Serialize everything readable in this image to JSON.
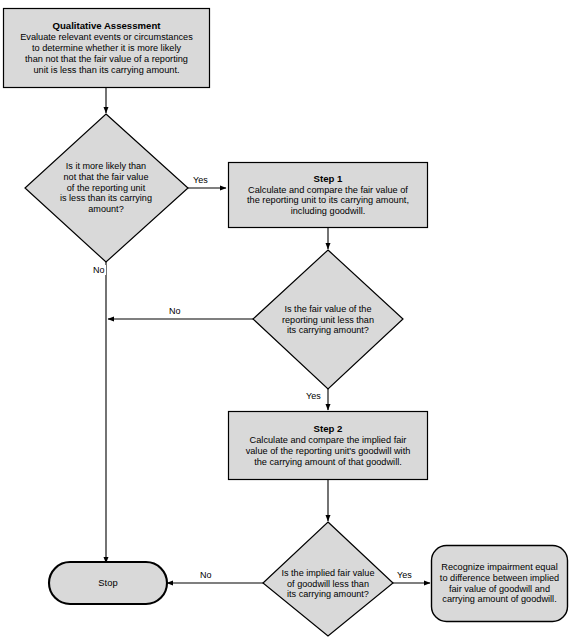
{
  "diagram": {
    "type": "flowchart",
    "top_caption": "",
    "colors": {
      "shape_fill": "#d9d9d9",
      "shape_stroke": "#000000",
      "connector": "#000000",
      "text": "#000000",
      "background": "#ffffff"
    },
    "nodes": {
      "qualitative_assessment": {
        "shape": "process",
        "title": "Qualitative Assessment",
        "lines": [
          "Evaluate relevant events or circumstances",
          "to determine whether it is more likely",
          "than not that the fair value of a reporting",
          "unit is less than its carrying amount."
        ]
      },
      "decision_1": {
        "shape": "decision",
        "lines": [
          "Is it more likely than",
          "not that the fair value",
          "of the reporting unit",
          "is less than its carrying",
          "amount?"
        ]
      },
      "step_1": {
        "shape": "process",
        "title": "Step 1",
        "lines": [
          "Calculate and compare the fair value of",
          "the reporting unit to its carrying amount,",
          "including goodwill."
        ]
      },
      "decision_2": {
        "shape": "decision",
        "lines": [
          "Is the fair value of the",
          "reporting unit less than",
          "its carrying amount?"
        ]
      },
      "step_2": {
        "shape": "process",
        "title": "Step 2",
        "lines": [
          "Calculate and compare the implied fair",
          "value of the reporting unit's goodwill with",
          "the carrying amount of that goodwill."
        ]
      },
      "decision_3": {
        "shape": "decision",
        "lines": [
          "Is the implied fair value",
          "of goodwill less than",
          "its carrying amount?"
        ]
      },
      "stop": {
        "shape": "terminator",
        "label": "Stop"
      },
      "recognize_impairment": {
        "shape": "terminator",
        "lines": [
          "Recognize impairment equal",
          "to difference between implied",
          "fair value of goodwill and",
          "carrying amount of goodwill."
        ]
      }
    },
    "edges": [
      {
        "id": "e1",
        "from": "qualitative_assessment",
        "to": "decision_1",
        "label": ""
      },
      {
        "id": "e2",
        "from": "decision_1",
        "to": "step_1",
        "label": "Yes"
      },
      {
        "id": "e3",
        "from": "decision_1",
        "to": "stop",
        "label": "No"
      },
      {
        "id": "e4",
        "from": "step_1",
        "to": "decision_2",
        "label": ""
      },
      {
        "id": "e5",
        "from": "decision_2",
        "to": "stop",
        "label": "No"
      },
      {
        "id": "e6",
        "from": "decision_2",
        "to": "step_2",
        "label": "Yes"
      },
      {
        "id": "e7",
        "from": "step_2",
        "to": "decision_3",
        "label": ""
      },
      {
        "id": "e8",
        "from": "decision_3",
        "to": "stop",
        "label": "No"
      },
      {
        "id": "e9",
        "from": "decision_3",
        "to": "recognize_impairment",
        "label": "Yes"
      }
    ]
  }
}
